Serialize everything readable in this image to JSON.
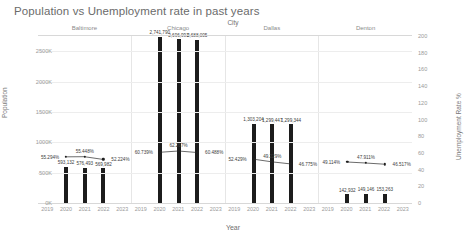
{
  "chart_data": {
    "type": "bar",
    "title": "Population vs Unemployment rate in past years",
    "xlabel": "Year",
    "ylabel": "Population",
    "y2label": "Unemployment Rate %",
    "group_label": "City",
    "grid": true,
    "legend": "none",
    "x": [
      "2019",
      "2020",
      "2021",
      "2022",
      "2023"
    ],
    "categories": [
      "2020",
      "2021",
      "2022"
    ],
    "ylim": [
      0,
      2750
    ],
    "y2lim": [
      0,
      200
    ],
    "yticks": [
      "0K",
      "500K",
      "1000K",
      "1500K",
      "2000K",
      "2500K"
    ],
    "ytick_values": [
      0,
      500,
      1000,
      1500,
      2000,
      2500
    ],
    "y2ticks": [
      "0",
      "20",
      "40",
      "60",
      "80",
      "100",
      "120",
      "140",
      "160",
      "180",
      "200"
    ],
    "y2tick_values": [
      0,
      20,
      40,
      60,
      80,
      100,
      120,
      140,
      160,
      180,
      200
    ],
    "panels": [
      {
        "name": "Baltimore",
        "bars": {
          "name": "Population",
          "values": [
            593132,
            576493,
            569982
          ],
          "labels": [
            "593,132",
            "576,493",
            "569,982"
          ]
        },
        "line": {
          "name": "Unemployment Rate %",
          "values": [
            55.294,
            55.448,
            52.224
          ],
          "labels": [
            "55.294%",
            "55.448%",
            "52.224%"
          ]
        }
      },
      {
        "name": "Chicago",
        "bars": {
          "name": "Population",
          "values": [
            2741790,
            2696993,
            2688005
          ],
          "labels": [
            "2,741,790",
            "2,696,993",
            "2,688,005"
          ]
        },
        "line": {
          "name": "Unemployment Rate %",
          "values": [
            60.739,
            62.267,
            60.488
          ],
          "labels": [
            "60.739%",
            "62.267%",
            "60.488%"
          ]
        }
      },
      {
        "name": "Dallas",
        "bars": {
          "name": "Population",
          "values": [
            1303204,
            1299447,
            1299344
          ],
          "labels": [
            "1,303,204",
            "1,299,447",
            "1,299,344"
          ]
        },
        "line": {
          "name": "Unemployment Rate %",
          "values": [
            52.429,
            49.229,
            46.775
          ],
          "labels": [
            "52.429%",
            "49.229%",
            "46.775%"
          ]
        }
      },
      {
        "name": "Denton",
        "bars": {
          "name": "Population",
          "values": [
            142932,
            149146,
            153263
          ],
          "labels": [
            "142,932",
            "149,146",
            "153,263"
          ]
        },
        "line": {
          "name": "Unemployment Rate %",
          "values": [
            49.114,
            47.911,
            46.517
          ],
          "labels": [
            "49.114%",
            "47.911%",
            "46.517%"
          ]
        }
      }
    ]
  }
}
